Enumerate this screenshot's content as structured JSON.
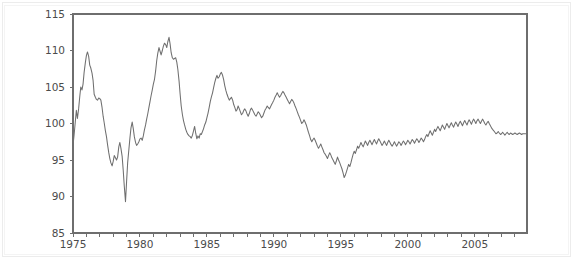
{
  "chart_data": {
    "type": "line",
    "title": "",
    "subtitle": "",
    "xlabel": "",
    "ylabel": "",
    "xlim": [
      1975.0,
      2008.9
    ],
    "ylim": [
      85,
      115
    ],
    "grid": false,
    "legend": null,
    "legend_position": "none",
    "series_name": "index",
    "line_color": "#6f6f6f",
    "background_color": "#ffffff",
    "axis_color": "#6e6e6e",
    "text_color": "#4b4b4b",
    "y_ticks": [
      85,
      90,
      95,
      100,
      105,
      110,
      115
    ],
    "y_tick_labels": [
      "85",
      "90",
      "95",
      "100",
      "105",
      "110",
      "115"
    ],
    "x_ticks": [
      1975,
      1976,
      1977,
      1978,
      1979,
      1980,
      1981,
      1982,
      1983,
      1984,
      1985,
      1986,
      1987,
      1988,
      1989,
      1990,
      1991,
      1992,
      1993,
      1994,
      1995,
      1996,
      1997,
      1998,
      1999,
      2000,
      2001,
      2002,
      2003,
      2004,
      2005,
      2006,
      2007,
      2008
    ],
    "x_tick_labels": [
      "1975",
      "",
      "",
      "",
      "",
      "1980",
      "",
      "",
      "",
      "",
      "1985",
      "",
      "",
      "",
      "",
      "1990",
      "",
      "",
      "",
      "",
      "1995",
      "",
      "",
      "",
      "",
      "2000",
      "",
      "",
      "",
      "",
      "2005",
      "",
      "",
      ""
    ],
    "x_major_labels": [
      "1975",
      "1980",
      "1985",
      "1990",
      "1995",
      "2000",
      "2005"
    ],
    "x_major_values": [
      1975,
      1980,
      1985,
      1990,
      1995,
      2000,
      2005
    ],
    "annotations": [],
    "x": [
      1975.0,
      1975.08,
      1975.17,
      1975.25,
      1975.33,
      1975.42,
      1975.5,
      1975.58,
      1975.67,
      1975.75,
      1975.83,
      1975.92,
      1976.0,
      1976.08,
      1976.17,
      1976.25,
      1976.33,
      1976.42,
      1976.5,
      1976.58,
      1976.67,
      1976.75,
      1976.83,
      1976.92,
      1977.0,
      1977.08,
      1977.17,
      1977.25,
      1977.33,
      1977.42,
      1977.5,
      1977.58,
      1977.67,
      1977.75,
      1977.83,
      1977.92,
      1978.0,
      1978.08,
      1978.17,
      1978.25,
      1978.33,
      1978.42,
      1978.5,
      1978.58,
      1978.67,
      1978.75,
      1978.83,
      1978.92,
      1979.0,
      1979.08,
      1979.17,
      1979.25,
      1979.33,
      1979.42,
      1979.5,
      1979.58,
      1979.67,
      1979.75,
      1979.83,
      1979.92,
      1980.0,
      1980.08,
      1980.17,
      1980.25,
      1980.33,
      1980.42,
      1980.5,
      1980.58,
      1980.67,
      1980.75,
      1980.83,
      1980.92,
      1981.0,
      1981.08,
      1981.17,
      1981.25,
      1981.33,
      1981.42,
      1981.5,
      1981.58,
      1981.67,
      1981.75,
      1981.83,
      1981.92,
      1982.0,
      1982.08,
      1982.17,
      1982.25,
      1982.33,
      1982.42,
      1982.5,
      1982.58,
      1982.67,
      1982.75,
      1982.83,
      1982.92,
      1983.0,
      1983.08,
      1983.17,
      1983.25,
      1983.33,
      1983.42,
      1983.5,
      1983.58,
      1983.67,
      1983.75,
      1983.83,
      1983.92,
      1984.0,
      1984.08,
      1984.17,
      1984.25,
      1984.33,
      1984.42,
      1984.5,
      1984.58,
      1984.67,
      1984.75,
      1984.83,
      1984.92,
      1985.0,
      1985.08,
      1985.17,
      1985.25,
      1985.33,
      1985.42,
      1985.5,
      1985.58,
      1985.67,
      1985.75,
      1985.83,
      1985.92,
      1986.0,
      1986.08,
      1986.17,
      1986.25,
      1986.33,
      1986.42,
      1986.5,
      1986.58,
      1986.67,
      1986.75,
      1986.83,
      1986.92,
      1987.0,
      1987.08,
      1987.17,
      1987.25,
      1987.33,
      1987.42,
      1987.5,
      1987.58,
      1987.67,
      1987.75,
      1987.83,
      1987.92,
      1988.0,
      1988.08,
      1988.17,
      1988.25,
      1988.33,
      1988.42,
      1988.5,
      1988.58,
      1988.67,
      1988.75,
      1988.83,
      1988.92,
      1989.0,
      1989.08,
      1989.17,
      1989.25,
      1989.33,
      1989.42,
      1989.5,
      1989.58,
      1989.67,
      1989.75,
      1989.83,
      1989.92,
      1990.0,
      1990.08,
      1990.17,
      1990.25,
      1990.33,
      1990.42,
      1990.5,
      1990.58,
      1990.67,
      1990.75,
      1990.83,
      1990.92,
      1991.0,
      1991.08,
      1991.17,
      1991.25,
      1991.33,
      1991.42,
      1991.5,
      1991.58,
      1991.67,
      1991.75,
      1991.83,
      1991.92,
      1992.0,
      1992.08,
      1992.17,
      1992.25,
      1992.33,
      1992.42,
      1992.5,
      1992.58,
      1992.67,
      1992.75,
      1992.83,
      1992.92,
      1993.0,
      1993.08,
      1993.17,
      1993.25,
      1993.33,
      1993.42,
      1993.5,
      1993.58,
      1993.67,
      1993.75,
      1993.83,
      1993.92,
      1994.0,
      1994.08,
      1994.17,
      1994.25,
      1994.33,
      1994.42,
      1994.5,
      1994.58,
      1994.67,
      1994.75,
      1994.83,
      1994.92,
      1995.0,
      1995.08,
      1995.17,
      1995.25,
      1995.33,
      1995.42,
      1995.5,
      1995.58,
      1995.67,
      1995.75,
      1995.83,
      1995.92,
      1996.0,
      1996.08,
      1996.17,
      1996.25,
      1996.33,
      1996.42,
      1996.5,
      1996.58,
      1996.67,
      1996.75,
      1996.83,
      1996.92,
      1997.0,
      1997.08,
      1997.17,
      1997.25,
      1997.33,
      1997.42,
      1997.5,
      1997.58,
      1997.67,
      1997.75,
      1997.83,
      1997.92,
      1998.0,
      1998.08,
      1998.17,
      1998.25,
      1998.33,
      1998.42,
      1998.5,
      1998.58,
      1998.67,
      1998.75,
      1998.83,
      1998.92,
      1999.0,
      1999.08,
      1999.17,
      1999.25,
      1999.33,
      1999.42,
      1999.5,
      1999.58,
      1999.67,
      1999.75,
      1999.83,
      1999.92,
      2000.0,
      2000.08,
      2000.17,
      2000.25,
      2000.33,
      2000.42,
      2000.5,
      2000.58,
      2000.67,
      2000.75,
      2000.83,
      2000.92,
      2001.0,
      2001.08,
      2001.17,
      2001.25,
      2001.33,
      2001.42,
      2001.5,
      2001.58,
      2001.67,
      2001.75,
      2001.83,
      2001.92,
      2002.0,
      2002.08,
      2002.17,
      2002.25,
      2002.33,
      2002.42,
      2002.5,
      2002.58,
      2002.67,
      2002.75,
      2002.83,
      2002.92,
      2003.0,
      2003.08,
      2003.17,
      2003.25,
      2003.33,
      2003.42,
      2003.5,
      2003.58,
      2003.67,
      2003.75,
      2003.83,
      2003.92,
      2004.0,
      2004.08,
      2004.17,
      2004.25,
      2004.33,
      2004.42,
      2004.5,
      2004.58,
      2004.67,
      2004.75,
      2004.83,
      2004.92,
      2005.0,
      2005.08,
      2005.17,
      2005.25,
      2005.33,
      2005.42,
      2005.5,
      2005.58,
      2005.67,
      2005.75,
      2005.83,
      2005.92,
      2006.0,
      2006.08,
      2006.17,
      2006.25,
      2006.33,
      2006.42,
      2006.5,
      2006.58,
      2006.67,
      2006.75,
      2006.83,
      2006.92,
      2007.0,
      2007.08,
      2007.17,
      2007.25,
      2007.33,
      2007.42,
      2007.5,
      2007.58,
      2007.67,
      2007.75,
      2007.83,
      2007.92,
      2008.0,
      2008.08,
      2008.17,
      2008.25,
      2008.33,
      2008.42,
      2008.5,
      2008.58,
      2008.67,
      2008.8
    ],
    "y": [
      97.0,
      98.4,
      100.2,
      101.8,
      100.7,
      102.0,
      103.6,
      105.0,
      104.6,
      105.4,
      107.0,
      108.3,
      109.3,
      109.8,
      109.2,
      108.0,
      107.6,
      106.9,
      105.9,
      104.0,
      103.6,
      103.3,
      103.2,
      103.5,
      103.4,
      103.2,
      102.2,
      101.0,
      100.1,
      99.0,
      98.2,
      97.1,
      96.0,
      95.2,
      94.6,
      94.2,
      94.8,
      95.6,
      95.3,
      95.0,
      95.4,
      96.8,
      97.4,
      96.6,
      95.5,
      93.6,
      91.4,
      89.3,
      92.0,
      94.6,
      96.4,
      98.0,
      99.4,
      100.2,
      99.3,
      98.2,
      97.4,
      97.0,
      97.2,
      97.5,
      97.9,
      98.0,
      97.7,
      98.3,
      99.1,
      99.8,
      100.6,
      101.3,
      102.2,
      103.0,
      103.8,
      104.6,
      105.4,
      106.0,
      107.2,
      108.6,
      109.6,
      110.4,
      109.9,
      109.4,
      110.0,
      110.6,
      111.0,
      110.8,
      110.4,
      111.2,
      111.8,
      110.9,
      109.7,
      109.0,
      108.8,
      108.9,
      109.0,
      108.4,
      107.4,
      105.8,
      104.0,
      102.4,
      101.2,
      100.4,
      99.8,
      99.2,
      98.8,
      98.5,
      98.3,
      98.2,
      98.0,
      98.4,
      99.0,
      99.6,
      98.6,
      97.9,
      98.3,
      98.0,
      98.6,
      98.5,
      98.9,
      99.3,
      99.8,
      100.2,
      100.8,
      101.4,
      102.2,
      103.0,
      103.6,
      104.2,
      104.9,
      105.6,
      106.2,
      106.6,
      106.2,
      106.4,
      106.8,
      107.0,
      106.6,
      106.0,
      105.2,
      104.5,
      104.0,
      103.6,
      103.2,
      103.4,
      103.6,
      103.2,
      102.6,
      102.2,
      101.7,
      101.9,
      102.4,
      102.0,
      101.6,
      101.2,
      101.4,
      101.8,
      102.0,
      101.7,
      101.3,
      101.0,
      101.4,
      101.9,
      102.1,
      101.8,
      101.5,
      101.2,
      101.0,
      101.3,
      101.6,
      101.4,
      101.1,
      100.8,
      101.0,
      101.4,
      101.8,
      102.1,
      102.4,
      102.2,
      102.0,
      102.3,
      102.6,
      102.9,
      103.2,
      103.6,
      103.9,
      104.2,
      103.9,
      103.6,
      103.8,
      104.1,
      104.4,
      104.2,
      103.9,
      103.6,
      103.3,
      103.0,
      102.7,
      103.0,
      103.3,
      103.1,
      102.8,
      102.4,
      102.0,
      101.6,
      101.2,
      100.8,
      100.4,
      100.0,
      100.2,
      100.5,
      100.2,
      99.8,
      99.3,
      98.8,
      98.3,
      97.8,
      97.5,
      97.8,
      98.0,
      97.7,
      97.3,
      96.9,
      96.6,
      96.9,
      97.2,
      96.8,
      96.4,
      96.0,
      95.8,
      95.5,
      95.2,
      95.6,
      96.0,
      95.7,
      95.3,
      95.0,
      94.7,
      94.4,
      94.9,
      95.4,
      95.0,
      94.6,
      94.2,
      93.8,
      93.2,
      92.6,
      92.9,
      93.4,
      93.9,
      94.4,
      94.1,
      94.6,
      95.2,
      95.8,
      96.2,
      95.9,
      96.4,
      96.9,
      96.6,
      97.0,
      97.4,
      97.1,
      96.8,
      97.2,
      97.6,
      97.3,
      97.0,
      97.4,
      97.7,
      97.4,
      97.1,
      97.5,
      97.8,
      97.5,
      97.2,
      97.6,
      97.9,
      97.6,
      97.3,
      97.0,
      97.3,
      97.6,
      97.3,
      97.0,
      97.4,
      97.7,
      97.4,
      97.1,
      96.9,
      97.2,
      97.5,
      97.2,
      96.9,
      97.2,
      97.5,
      97.3,
      97.0,
      97.3,
      97.6,
      97.4,
      97.1,
      97.4,
      97.7,
      97.5,
      97.2,
      97.5,
      97.8,
      97.6,
      97.3,
      97.6,
      97.9,
      97.7,
      97.4,
      97.7,
      98.0,
      97.8,
      97.5,
      97.8,
      98.2,
      98.5,
      98.2,
      98.6,
      99.0,
      98.7,
      98.4,
      98.8,
      99.2,
      98.9,
      99.3,
      99.6,
      99.3,
      99.0,
      99.4,
      99.8,
      99.5,
      99.2,
      99.6,
      100.0,
      99.7,
      99.4,
      99.8,
      100.1,
      99.8,
      99.5,
      99.9,
      100.2,
      99.9,
      99.6,
      100.0,
      100.3,
      100.0,
      99.7,
      100.1,
      100.4,
      100.1,
      99.8,
      100.2,
      100.5,
      100.2,
      99.9,
      100.3,
      100.6,
      100.3,
      100.0,
      100.4,
      100.6,
      100.3,
      100.0,
      100.3,
      100.6,
      100.3,
      100.0,
      99.8,
      100.1,
      100.3,
      100.0,
      99.7,
      99.4,
      99.2,
      99.0,
      98.8,
      98.6,
      98.7,
      98.9,
      98.7,
      98.5,
      98.6,
      98.8,
      98.6,
      98.4,
      98.6,
      98.8,
      98.6,
      98.5,
      98.7,
      98.6,
      98.5,
      98.6,
      98.7,
      98.6,
      98.5,
      98.6,
      98.7,
      98.6,
      98.5,
      98.6,
      98.6,
      98.6
    ]
  },
  "axes": {
    "plot_left_px": 73,
    "plot_right_px": 527,
    "plot_top_px": 14,
    "plot_bottom_px": 233
  }
}
